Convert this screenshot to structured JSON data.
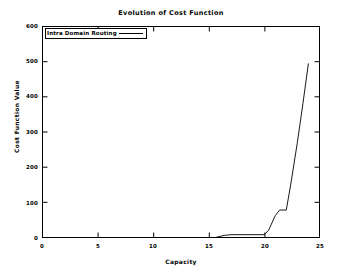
{
  "chart_data": {
    "type": "line",
    "title": "Evolution of Cost Function",
    "xlabel": "Capacity",
    "ylabel": "Cost Function Value",
    "xlim": [
      0,
      25
    ],
    "ylim": [
      0,
      600
    ],
    "xticks": [
      "0",
      "5",
      "10",
      "15",
      "20",
      "25"
    ],
    "xtick_values": [
      0,
      5,
      10,
      15,
      20,
      25
    ],
    "yticks": [
      "0",
      "100",
      "200",
      "300",
      "400",
      "500",
      "600"
    ],
    "ytick_values": [
      0,
      100,
      200,
      300,
      400,
      500,
      600
    ],
    "grid": false,
    "legend_position": "top-left",
    "line_color": "#000000",
    "background_color": "#ffffff",
    "series": [
      {
        "name": "Intra Domain Routing",
        "x": [
          0,
          5,
          10,
          15,
          15.6,
          16.4,
          17.0,
          20.0,
          20.4,
          21.0,
          21.4,
          22.0,
          22.4,
          23.0,
          23.5,
          24.0
        ],
        "values": [
          0,
          0,
          0,
          0,
          0,
          6,
          8,
          8,
          20,
          62,
          78,
          78,
          150,
          270,
          380,
          495
        ]
      }
    ]
  },
  "legend": {
    "entry_label": "Intra Domain Routing"
  }
}
